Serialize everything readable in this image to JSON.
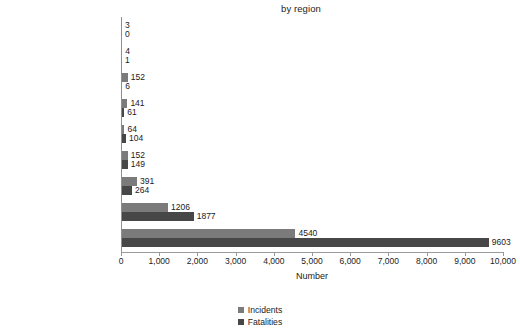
{
  "chart_data": {
    "type": "bar",
    "orientation": "horizontal",
    "title": "by region",
    "xlabel": "Number",
    "ylabel": "",
    "xlim": [
      0,
      10000
    ],
    "xticks": [
      0,
      1000,
      2000,
      3000,
      4000,
      5000,
      6000,
      7000,
      8000,
      9000,
      10000
    ],
    "xtick_labels": [
      "0",
      "1,000",
      "2,000",
      "3,000",
      "4,000",
      "5,000",
      "6,000",
      "7,000",
      "8,000",
      "9,000",
      "10,000"
    ],
    "grid": false,
    "legend_position": "bottom",
    "categories": [
      "East & Central Asia",
      "North America",
      "Western Europe",
      "Eastern Europe",
      "Africa",
      "Latin America & Caribbean",
      "Southeast Asia & Oceania",
      "South Asia",
      "Middle East / Persian Gulf"
    ],
    "series": [
      {
        "name": "Incidents",
        "color": "#7b7b7b",
        "values": [
          3,
          4,
          152,
          141,
          64,
          152,
          391,
          1206,
          4540
        ],
        "labels": [
          "3",
          "4",
          "152",
          "141",
          "64",
          "152",
          "391",
          "1206",
          "4540"
        ]
      },
      {
        "name": "Fatalities",
        "color": "#474747",
        "values": [
          0,
          1,
          6,
          61,
          104,
          149,
          264,
          1877,
          9603
        ],
        "labels": [
          "0",
          "1",
          "6",
          "61",
          "104",
          "149",
          "264",
          "1877",
          "9603"
        ]
      }
    ]
  }
}
